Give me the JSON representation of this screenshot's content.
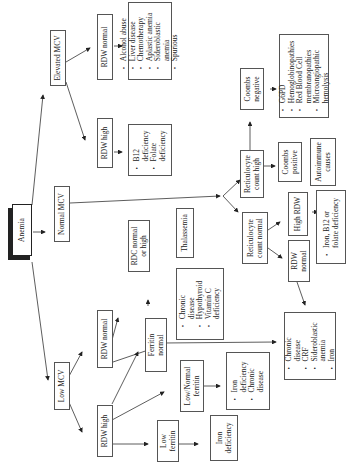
{
  "diagram": {
    "title": "Anemia",
    "nodes": {
      "anemia": {
        "label": "Anemia"
      },
      "elevated_mcv": {
        "label": "Elevated MCV"
      },
      "normal_mcv": {
        "label": "Normal MCV"
      },
      "low_mcv": {
        "label": "Low MCV"
      },
      "elev_rdw_normal": {
        "label": "RDW normal"
      },
      "elev_rdw_normal_causes": {
        "items": [
          "Alcohol abuse",
          "Liver disease",
          "Chemotherapy",
          "Aplastic anemia",
          "Sideroblastic",
          "anemia",
          "Spurious"
        ]
      },
      "elev_rdw_high": {
        "label": "RDW high"
      },
      "elev_rdw_high_causes": {
        "items": [
          "B12",
          "deficiency",
          "Folate",
          "deficiency"
        ]
      },
      "retic_high": {
        "label_1": "Reticulocyte",
        "label_2": "count high"
      },
      "retic_normal": {
        "label_1": "Reticulocyte",
        "label_2": "count normal"
      },
      "coombs_negative": {
        "label_1": "Coombs",
        "label_2": "negative"
      },
      "coombs_negative_causes": {
        "items": [
          "G6PD",
          "Hemoglobinopathies",
          "Red Blood Cell",
          "membranopathies",
          "Microangiopathic",
          "hemolysis"
        ]
      },
      "coombs_positive": {
        "label_1": "Coombs",
        "label_2": "positive"
      },
      "autoimmune": {
        "label_1": "Autoimmune",
        "label_2": "causes"
      },
      "high_rdw": {
        "label": "High RDW"
      },
      "high_rdw_causes": {
        "items": [
          "Iron, B12 or",
          "folate deficiency"
        ]
      },
      "rn_rdw_normal": {
        "label_1": "RDW",
        "label_2": "normal"
      },
      "rdc_normal_high": {
        "label_1": "RDC  normal",
        "label_2": "or high"
      },
      "thalassemia": {
        "label": "Thalassemia"
      },
      "low_rdw_normal": {
        "label": "RDW normal"
      },
      "low_rdw_normal_causes": {
        "items": [
          "Chronic",
          "disease",
          "Hypothyroid",
          "Vitamin C",
          "deficiency"
        ]
      },
      "ferritin_normal": {
        "label_1": "Ferritin",
        "label_2": "normal"
      },
      "chronic_causes": {
        "items": [
          "Chronic",
          "disease",
          "CRF",
          "Sideroblastic",
          "anemia",
          "Iron"
        ]
      },
      "low_rdw_high": {
        "label": "RDW high"
      },
      "lownormal_ferritin": {
        "label_1": "Low/Normal",
        "label_2": "ferritin"
      },
      "lownormal_causes": {
        "items": [
          "Iron",
          "deficiency",
          "Chronic",
          "disease"
        ]
      },
      "low_ferritin": {
        "label_1": "Low",
        "label_2": "ferritin"
      },
      "iron_deficiency": {
        "label_1": "Iron",
        "label_2": "deficiency"
      }
    }
  }
}
